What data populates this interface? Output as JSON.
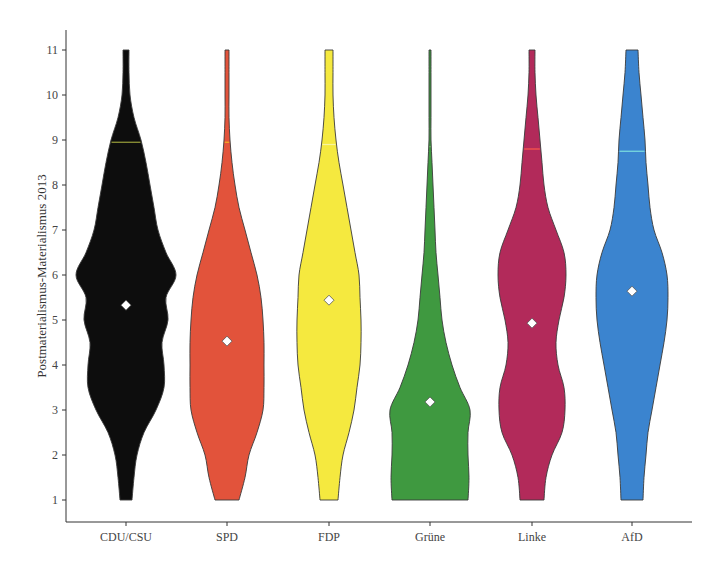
{
  "chart_data": {
    "type": "violin",
    "title": "",
    "xlabel": "",
    "ylabel": "Postmaterialismus-Materialismus 2013",
    "ylim": [
      1,
      11
    ],
    "yticks": [
      1,
      2,
      3,
      4,
      5,
      6,
      7,
      8,
      9,
      10,
      11
    ],
    "grid": false,
    "legend": "none",
    "categories": [
      "CDU/CSU",
      "SPD",
      "FDP",
      "Grüne",
      "Linke",
      "AfD"
    ],
    "means": [
      5.33,
      4.53,
      5.44,
      3.18,
      4.93,
      5.64
    ],
    "upper_quantile_marker": [
      8.95,
      8.95,
      8.9,
      8.85,
      8.8,
      8.75
    ],
    "colors": [
      "#0d0d0d",
      "#e2533b",
      "#f5e93f",
      "#3f9940",
      "#b22a5a",
      "#3b84cf"
    ],
    "marker_colors": [
      "#9aa03a",
      "#f2b020",
      "#f7f5a0",
      "#e8f0d0",
      "#ff5a4a",
      "#7de0e0"
    ],
    "density_profiles": {
      "y_levels": [
        1,
        1.5,
        2,
        2.5,
        3,
        3.5,
        4,
        4.5,
        5,
        5.5,
        6,
        6.5,
        7,
        7.5,
        8,
        8.5,
        9,
        9.5,
        10,
        10.5,
        11
      ],
      "half_widths_px": [
        [
          6,
          8,
          11,
          18,
          30,
          38,
          38,
          36,
          42,
          40,
          50,
          40,
          32,
          28,
          24,
          20,
          15,
          8,
          4,
          3,
          3
        ],
        [
          12,
          18,
          22,
          30,
          36,
          37,
          37,
          37,
          36,
          34,
          30,
          24,
          18,
          12,
          8,
          5,
          3,
          2,
          2,
          2,
          2
        ],
        [
          9,
          11,
          14,
          20,
          25,
          28,
          31,
          32,
          32,
          31,
          30,
          26,
          22,
          18,
          14,
          10,
          7,
          5,
          4,
          4,
          4
        ],
        [
          38,
          39,
          38,
          38,
          40,
          30,
          22,
          16,
          12,
          10,
          8,
          6,
          5,
          4,
          3,
          2,
          1,
          1,
          1,
          1,
          1
        ],
        [
          12,
          14,
          20,
          30,
          33,
          32,
          26,
          24,
          27,
          32,
          34,
          32,
          24,
          16,
          12,
          10,
          8,
          6,
          4,
          3,
          3
        ],
        [
          11,
          12,
          14,
          16,
          20,
          24,
          28,
          32,
          35,
          36,
          35,
          30,
          22,
          18,
          16,
          14,
          13,
          11,
          9,
          7,
          6
        ]
      ]
    }
  },
  "axes": {
    "y_label": "Postmaterialismus-Materialismus 2013",
    "y_tick_labels": [
      "1",
      "2",
      "3",
      "4",
      "5",
      "6",
      "7",
      "8",
      "9",
      "10",
      "11"
    ],
    "x_tick_labels": [
      "CDU/CSU",
      "SPD",
      "FDP",
      "Grüne",
      "Linke",
      "AfD"
    ]
  }
}
